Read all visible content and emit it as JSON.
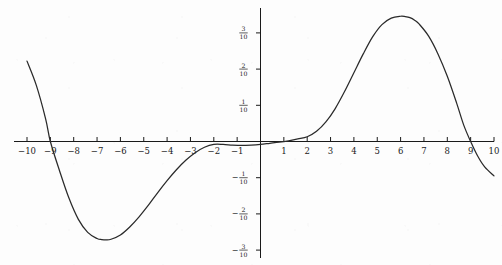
{
  "figure": {
    "title": "",
    "background_color": "#fdfdfd",
    "curve_color": "#2a2a2a",
    "axis_color": "#1a1a1a"
  },
  "chart_data": {
    "type": "line",
    "title": "",
    "xlabel": "",
    "ylabel": "",
    "xlim": [
      -10,
      10
    ],
    "ylim": [
      -0.32,
      0.37
    ],
    "grid": false,
    "legend": null,
    "x_ticks": [
      -10,
      -9,
      -8,
      -7,
      -6,
      -5,
      -4,
      -3,
      -2,
      -1,
      1,
      2,
      3,
      4,
      5,
      6,
      7,
      8,
      9,
      10
    ],
    "x_tick_labels": [
      "-10",
      "-9",
      "-8",
      "-7",
      "-6",
      "-5",
      "-4",
      "-3",
      "-2",
      "-1",
      "1",
      "2",
      "3",
      "4",
      "5",
      "6",
      "7",
      "8",
      "9",
      "10"
    ],
    "y_ticks": [
      0.3,
      0.2,
      0.1,
      -0.1,
      -0.2,
      -0.3
    ],
    "y_tick_labels": [
      {
        "sign": "",
        "numerator": "3",
        "denominator": "10"
      },
      {
        "sign": "",
        "numerator": "2",
        "denominator": "10"
      },
      {
        "sign": "",
        "numerator": "1",
        "denominator": "10"
      },
      {
        "sign": "−",
        "numerator": "1",
        "denominator": "10"
      },
      {
        "sign": "−",
        "numerator": "2",
        "denominator": "10"
      },
      {
        "sign": "−",
        "numerator": "3",
        "denominator": "10"
      }
    ],
    "series": [
      {
        "name": "curve",
        "x": [
          -10.0,
          -9.6,
          -9.2,
          -9.0,
          -8.6,
          -8.2,
          -7.8,
          -7.4,
          -7.0,
          -6.8,
          -6.6,
          -6.4,
          -6.0,
          -5.6,
          -5.2,
          -4.8,
          -4.4,
          -4.0,
          -3.6,
          -3.2,
          -2.8,
          -2.4,
          -2.0,
          -1.6,
          -1.2,
          -0.8,
          -0.4,
          0.0,
          0.4,
          0.8,
          1.2,
          1.6,
          2.0,
          2.4,
          2.8,
          3.2,
          3.6,
          4.0,
          4.4,
          4.8,
          5.2,
          5.6,
          6.0,
          6.2,
          6.4,
          6.6,
          6.8,
          7.2,
          7.6,
          8.0,
          8.4,
          8.7,
          9.0,
          9.3,
          9.6,
          10.0
        ],
        "y": [
          0.222,
          0.155,
          0.062,
          0.0,
          -0.082,
          -0.157,
          -0.215,
          -0.251,
          -0.268,
          -0.271,
          -0.272,
          -0.27,
          -0.258,
          -0.236,
          -0.208,
          -0.176,
          -0.141,
          -0.108,
          -0.078,
          -0.052,
          -0.031,
          -0.016,
          -0.008,
          -0.008,
          -0.01,
          -0.011,
          -0.01,
          -0.008,
          -0.005,
          -0.002,
          0.002,
          0.007,
          0.013,
          0.028,
          0.054,
          0.091,
          0.138,
          0.19,
          0.242,
          0.289,
          0.323,
          0.341,
          0.346,
          0.345,
          0.342,
          0.335,
          0.324,
          0.291,
          0.242,
          0.18,
          0.106,
          0.046,
          0.0,
          -0.04,
          -0.07,
          -0.095
        ]
      }
    ]
  }
}
